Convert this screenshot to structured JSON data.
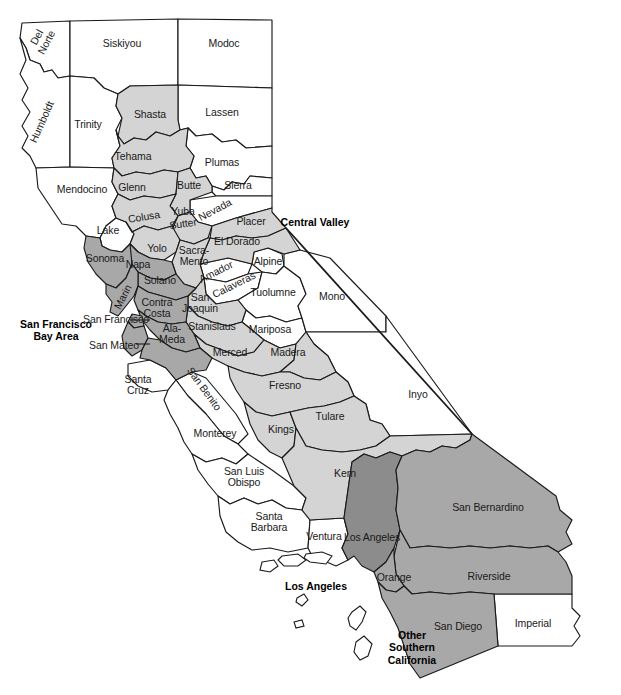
{
  "map": {
    "title": "California Counties by Region",
    "width": 621,
    "height": 695,
    "background": "#ffffff",
    "outline_color": "#1a1a1a"
  },
  "legend_regions": [
    {
      "id": "central-valley",
      "label": "Central Valley",
      "fill": "#d4d4d4",
      "x": 315,
      "y": 222
    },
    {
      "id": "san-francisco-bay-area",
      "label": "San Francisco\nBay Area",
      "fill": "#a8a8a8",
      "x": 56,
      "y": 330
    },
    {
      "id": "los-angeles",
      "label": "Los Angeles",
      "fill": "#8c8c8c",
      "x": 316,
      "y": 586
    },
    {
      "id": "other-southern-california",
      "label": "Other\nSouthern\nCalifornia",
      "fill": "#a8a8a8",
      "x": 412,
      "y": 648
    }
  ],
  "colors": {
    "central_valley": "#d4d4d4",
    "bay_area": "#a8a8a8",
    "los_angeles": "#8c8c8c",
    "other_socal": "#a8a8a8",
    "unshaded": "#ffffff",
    "border": "#1a1a1a"
  },
  "counties": [
    {
      "name": "Del\nNorte",
      "x": 42,
      "y": 40,
      "rot": -62,
      "region": "unshaded"
    },
    {
      "name": "Siskiyou",
      "x": 122,
      "y": 44,
      "rot": 0,
      "region": "unshaded"
    },
    {
      "name": "Modoc",
      "x": 224,
      "y": 44,
      "rot": 0,
      "region": "unshaded"
    },
    {
      "name": "Humboldt",
      "x": 42,
      "y": 122,
      "rot": -66,
      "region": "unshaded"
    },
    {
      "name": "Trinity",
      "x": 88,
      "y": 125,
      "rot": 0,
      "region": "unshaded"
    },
    {
      "name": "Shasta",
      "x": 150,
      "y": 115,
      "rot": 0,
      "region": "central-valley"
    },
    {
      "name": "Lassen",
      "x": 222,
      "y": 113,
      "rot": 0,
      "region": "unshaded"
    },
    {
      "name": "Tehama",
      "x": 133,
      "y": 157,
      "rot": 0,
      "region": "central-valley"
    },
    {
      "name": "Plumas",
      "x": 222,
      "y": 163,
      "rot": 0,
      "region": "unshaded"
    },
    {
      "name": "Mendocino",
      "x": 82,
      "y": 190,
      "rot": 0,
      "region": "unshaded"
    },
    {
      "name": "Glenn",
      "x": 132,
      "y": 188,
      "rot": 0,
      "region": "central-valley"
    },
    {
      "name": "Butte",
      "x": 189,
      "y": 186,
      "rot": 0,
      "region": "central-valley"
    },
    {
      "name": "Sierra",
      "x": 238,
      "y": 186,
      "rot": 0,
      "region": "unshaded"
    },
    {
      "name": "Colusa",
      "x": 144,
      "y": 217,
      "rot": -9,
      "region": "central-valley"
    },
    {
      "name": "Yuba",
      "x": 183,
      "y": 212,
      "rot": 0,
      "region": "central-valley"
    },
    {
      "name": "Nevada",
      "x": 215,
      "y": 210,
      "rot": -28,
      "region": "unshaded"
    },
    {
      "name": "Sutter",
      "x": 183,
      "y": 224,
      "rot": -8,
      "region": "central-valley"
    },
    {
      "name": "Lake",
      "x": 108,
      "y": 231,
      "rot": 0,
      "region": "unshaded"
    },
    {
      "name": "Placer",
      "x": 251,
      "y": 222,
      "rot": 0,
      "region": "central-valley"
    },
    {
      "name": "Yolo",
      "x": 157,
      "y": 249,
      "rot": 0,
      "region": "central-valley"
    },
    {
      "name": "Sacra-\nMento",
      "x": 194,
      "y": 256,
      "rot": 0,
      "region": "central-valley"
    },
    {
      "name": "El Dorado",
      "x": 237,
      "y": 242,
      "rot": 0,
      "region": "central-valley"
    },
    {
      "name": "Sonoma",
      "x": 105,
      "y": 259,
      "rot": 0,
      "region": "bay-area"
    },
    {
      "name": "Napa",
      "x": 138,
      "y": 265,
      "rot": 0,
      "region": "bay-area"
    },
    {
      "name": "Alpine",
      "x": 268,
      "y": 262,
      "rot": 0,
      "region": "unshaded"
    },
    {
      "name": "Amador",
      "x": 216,
      "y": 272,
      "rot": -26,
      "region": "unshaded"
    },
    {
      "name": "Solano",
      "x": 160,
      "y": 281,
      "rot": 0,
      "region": "bay-area"
    },
    {
      "name": "Calaveras",
      "x": 234,
      "y": 285,
      "rot": -26,
      "region": "unshaded"
    },
    {
      "name": "Marin",
      "x": 123,
      "y": 297,
      "rot": -62,
      "region": "bay-area"
    },
    {
      "name": "Contra\nCosta",
      "x": 157,
      "y": 308,
      "rot": 0,
      "region": "bay-area"
    },
    {
      "name": "San\nJoaquin",
      "x": 200,
      "y": 303,
      "rot": 0,
      "region": "central-valley"
    },
    {
      "name": "Tuolumne",
      "x": 273,
      "y": 293,
      "rot": 0,
      "region": "unshaded"
    },
    {
      "name": "Mono",
      "x": 332,
      "y": 297,
      "rot": 0,
      "region": "unshaded"
    },
    {
      "name": "Stanislaus",
      "x": 212,
      "y": 327,
      "rot": 0,
      "region": "central-valley"
    },
    {
      "name": "Mariposa",
      "x": 270,
      "y": 330,
      "rot": 0,
      "region": "unshaded"
    },
    {
      "name": "Ala-\nMeda",
      "x": 172,
      "y": 334,
      "rot": 0,
      "region": "bay-area"
    },
    {
      "name": "Merced",
      "x": 230,
      "y": 353,
      "rot": 0,
      "region": "central-valley"
    },
    {
      "name": "Madera",
      "x": 288,
      "y": 353,
      "rot": 0,
      "region": "central-valley"
    },
    {
      "name": "Santa\nCruz",
      "x": 138,
      "y": 385,
      "rot": 0,
      "region": "unshaded"
    },
    {
      "name": "San Benito",
      "x": 204,
      "y": 389,
      "rot": 54,
      "region": "unshaded"
    },
    {
      "name": "Fresno",
      "x": 285,
      "y": 386,
      "rot": 0,
      "region": "central-valley"
    },
    {
      "name": "Inyo",
      "x": 418,
      "y": 395,
      "rot": 0,
      "region": "unshaded"
    },
    {
      "name": "Tulare",
      "x": 330,
      "y": 417,
      "rot": 0,
      "region": "central-valley"
    },
    {
      "name": "Kings",
      "x": 281,
      "y": 430,
      "rot": 0,
      "region": "central-valley"
    },
    {
      "name": "Monterey",
      "x": 215,
      "y": 434,
      "rot": 0,
      "region": "unshaded"
    },
    {
      "name": "San Luis\nObispo",
      "x": 244,
      "y": 477,
      "rot": 0,
      "region": "unshaded"
    },
    {
      "name": "Kern",
      "x": 345,
      "y": 474,
      "rot": 0,
      "region": "central-valley"
    },
    {
      "name": "San Bernardino",
      "x": 488,
      "y": 508,
      "rot": 0,
      "region": "other-socal"
    },
    {
      "name": "Santa\nBarbara",
      "x": 269,
      "y": 522,
      "rot": 0,
      "region": "unshaded"
    },
    {
      "name": "Ventura",
      "x": 324,
      "y": 537,
      "rot": 0,
      "region": "unshaded"
    },
    {
      "name": "Los Angeles",
      "x": 372,
      "y": 538,
      "rot": 0,
      "region": "los-angeles"
    },
    {
      "name": "Orange",
      "x": 394,
      "y": 578,
      "rot": 0,
      "region": "other-socal"
    },
    {
      "name": "Riverside",
      "x": 489,
      "y": 577,
      "rot": 0,
      "region": "other-socal"
    },
    {
      "name": "San Diego",
      "x": 458,
      "y": 627,
      "rot": 0,
      "region": "other-socal"
    },
    {
      "name": "Imperial",
      "x": 533,
      "y": 624,
      "rot": 0,
      "region": "unshaded"
    },
    {
      "name": "San Francisco",
      "x": 116,
      "y": 320,
      "rot": 0,
      "region": "bay-area",
      "callout": true
    },
    {
      "name": "San Mateo",
      "x": 114,
      "y": 346,
      "rot": 0,
      "region": "bay-area",
      "callout": true
    }
  ]
}
